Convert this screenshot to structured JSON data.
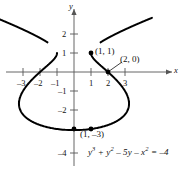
{
  "figure": {
    "equation_plain": "y^3 + y^2 - 5y - x^2 = -4",
    "curve_color": "#000000",
    "axis_color": "#555555",
    "text_color": "#111111"
  },
  "axes": {
    "x_name": "x",
    "y_name": "y",
    "x_ticks": [
      {
        "value": -3,
        "label": "–3"
      },
      {
        "value": -2,
        "label": "–2"
      },
      {
        "value": -1,
        "label": "–1"
      },
      {
        "value": 1,
        "label": "1"
      },
      {
        "value": 2,
        "label": "2"
      },
      {
        "value": 3,
        "label": "3"
      }
    ],
    "y_ticks": [
      {
        "value": 2,
        "label": "2"
      },
      {
        "value": 1,
        "label": "1"
      },
      {
        "value": -1,
        "label": "–1"
      },
      {
        "value": -2,
        "label": "–2"
      },
      {
        "value": -4,
        "label": "–4"
      }
    ]
  },
  "points": [
    {
      "id": "p1",
      "label": "(1, 1)",
      "x": 1,
      "y": 1
    },
    {
      "id": "p2",
      "label": "(2, 0)",
      "x": 2,
      "y": 0
    },
    {
      "id": "p3",
      "label": "(1, –3)",
      "x": 1,
      "y": -3
    },
    {
      "id": "p4",
      "label": "",
      "x": 0,
      "y": -3
    }
  ],
  "equation": {
    "t1": "y",
    "t1_sup": "3",
    "t2": " + y",
    "t2_sup": "2",
    "t3": " – 5y – x",
    "t3_sup": "2",
    "t4": " = –4"
  },
  "chart_data": {
    "type": "line",
    "xlabel": "x",
    "ylabel": "y",
    "xlim": [
      -3.6,
      3.9
    ],
    "ylim": [
      -4.4,
      2.9
    ],
    "grid": false,
    "legend": null,
    "relation": "x^2 = y^3 + y^2 - 5y + 4",
    "xticks": [
      -3,
      -2,
      -1,
      1,
      2,
      3
    ],
    "yticks": [
      2,
      1,
      -1,
      -2,
      -4
    ],
    "annotated_points": [
      {
        "label": "(1, 1)",
        "x": 1,
        "y": 1
      },
      {
        "label": "(2, 0)",
        "x": 2,
        "y": 0
      },
      {
        "label": "(1, –3)",
        "x": 1,
        "y": -3
      }
    ],
    "branches": [
      {
        "name": "closed-oval-lower",
        "description": "closed loop for y between -3.2 and 1, x from -2.6 to 2.6"
      },
      {
        "name": "open-branch-upper",
        "description": "open branch opening upward-outward for y above 1.56"
      }
    ]
  }
}
